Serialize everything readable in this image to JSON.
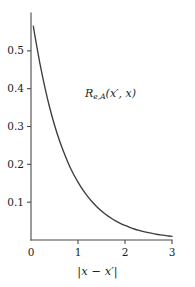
{
  "figure": {
    "background_color": "#ffffff",
    "axis_color": "#4a4a4a",
    "curve_color": "#3c3c3c",
    "text_color": "#1b1b1b"
  },
  "labels": {
    "curve_annotation_main": "R",
    "curve_annotation_sub": "e,A",
    "curve_annotation_args": "(x′, x)",
    "xaxis_title_text": "|x − x′|"
  },
  "chart_data": {
    "type": "line",
    "title": "",
    "subtitle": "",
    "xlabel": "|x − x′|",
    "ylabel": "",
    "annotations": [
      {
        "text": "R_{e,A}(x′, x)",
        "x": 1.15,
        "y": 0.385
      }
    ],
    "legend": [],
    "legend_position": "none",
    "grid": false,
    "xlim": [
      0,
      3.05
    ],
    "ylim": [
      0,
      0.6
    ],
    "xticks": [
      0,
      1,
      2,
      3
    ],
    "xticklabels": [
      "0",
      "1",
      "2",
      "3"
    ],
    "yticks": [
      0.1,
      0.2,
      0.3,
      0.4,
      0.5
    ],
    "yticklabels": [
      "0.1",
      "0.2",
      "0.3",
      "0.4",
      "0.5"
    ],
    "series": [
      {
        "name": "R_{e,A}(x′, x)",
        "color": "#3c3c3c",
        "x": [
          0.05,
          0.1,
          0.2,
          0.3,
          0.4,
          0.5,
          0.6,
          0.7,
          0.8,
          0.9,
          1.0,
          1.1,
          1.2,
          1.3,
          1.4,
          1.5,
          1.6,
          1.7,
          1.8,
          1.9,
          2.0,
          2.1,
          2.2,
          2.3,
          2.4,
          2.5,
          2.6,
          2.7,
          2.8,
          2.9,
          3.0
        ],
        "y": [
          0.565,
          0.528,
          0.46,
          0.401,
          0.349,
          0.304,
          0.265,
          0.231,
          0.201,
          0.175,
          0.153,
          0.133,
          0.116,
          0.101,
          0.088,
          0.0765,
          0.0667,
          0.0581,
          0.0506,
          0.0441,
          0.0384,
          0.0335,
          0.0291,
          0.0254,
          0.0221,
          0.0193,
          0.0168,
          0.0146,
          0.0127,
          0.0111,
          0.0097
        ]
      }
    ]
  }
}
